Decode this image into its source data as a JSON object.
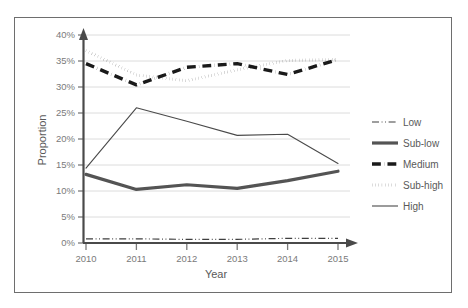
{
  "figure": {
    "top_fragment": "",
    "frame_color": "#6e6e6e",
    "background": "#ffffff"
  },
  "chart_data": {
    "type": "line",
    "title": "",
    "xlabel": "Year",
    "ylabel": "Proportion",
    "categories": [
      "2010",
      "2011",
      "2012",
      "2013",
      "2014",
      "2015"
    ],
    "x": [
      2010,
      2011,
      2012,
      2013,
      2014,
      2015
    ],
    "xlim": [
      2010,
      2015
    ],
    "ylim": [
      0,
      40
    ],
    "ytick_labels": [
      "0%",
      "5%",
      "10%",
      "15%",
      "20%",
      "25%",
      "30%",
      "35%",
      "40%"
    ],
    "yticks": [
      0,
      5,
      10,
      15,
      20,
      25,
      30,
      35,
      40
    ],
    "y_unit": "%",
    "grid": "horizontal",
    "legend_position": "right",
    "series": [
      {
        "name": "Low",
        "values": [
          0.8,
          0.8,
          0.7,
          0.7,
          0.9,
          0.9
        ],
        "style": "dash-dot-dot",
        "width": 1.2,
        "color": "#3f3f3f"
      },
      {
        "name": "Sub-low",
        "values": [
          13.2,
          10.3,
          11.2,
          10.5,
          12.0,
          13.8
        ],
        "style": "solid",
        "width": 3.2,
        "color": "#545454"
      },
      {
        "name": "Medium",
        "values": [
          34.5,
          30.4,
          33.8,
          34.5,
          32.4,
          35.3
        ],
        "style": "dash-dot",
        "width": 3.4,
        "color": "#1a1a1a"
      },
      {
        "name": "Sub-high",
        "values": [
          37.0,
          32.3,
          31.2,
          33.3,
          35.1,
          35.3
        ],
        "style": "dotted",
        "width": 3.0,
        "color": "#141414"
      },
      {
        "name": "High",
        "values": [
          14.4,
          26.0,
          23.4,
          20.7,
          20.9,
          15.3
        ],
        "style": "solid",
        "width": 1.1,
        "color": "#4a4a4a"
      }
    ]
  },
  "legend": {
    "entries": [
      {
        "label": "Low"
      },
      {
        "label": "Sub-low"
      },
      {
        "label": "Medium"
      },
      {
        "label": "Sub-high"
      },
      {
        "label": "High"
      }
    ]
  }
}
